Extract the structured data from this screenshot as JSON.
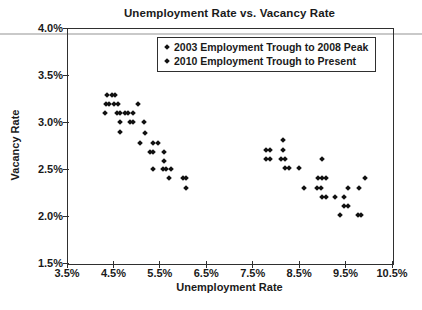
{
  "page": {
    "background": "#ffffff",
    "rule_color": "#c9c9c9",
    "text_color": "#1a1a1a",
    "marker_color": "#111111"
  },
  "chart_data": {
    "type": "scatter",
    "title": "Unemployment Rate vs. Vacancy Rate",
    "xlabel": "Unemployment Rate",
    "ylabel": "Vacancy Rate",
    "xlim": [
      3.5,
      10.5
    ],
    "ylim": [
      1.5,
      4.0
    ],
    "grid": false,
    "legend_position": "top-center-inside",
    "marker": "diamond",
    "x_ticks": [
      {
        "value": 3.5,
        "label": "3.5%"
      },
      {
        "value": 4.5,
        "label": "4.5%"
      },
      {
        "value": 5.5,
        "label": "5.5%"
      },
      {
        "value": 6.5,
        "label": "6.5%"
      },
      {
        "value": 7.5,
        "label": "7.5%"
      },
      {
        "value": 8.5,
        "label": "8.5%"
      },
      {
        "value": 9.5,
        "label": "9.5%"
      },
      {
        "value": 10.5,
        "label": "10.5%"
      }
    ],
    "y_ticks": [
      {
        "value": 4.0,
        "label": "4.0%"
      },
      {
        "value": 3.5,
        "label": "3.5%"
      },
      {
        "value": 3.0,
        "label": "3.0%"
      },
      {
        "value": 2.5,
        "label": "2.5%"
      },
      {
        "value": 2.0,
        "label": "2.0%"
      },
      {
        "value": 1.5,
        "label": "1.5%"
      }
    ],
    "series": [
      {
        "name": "2003 Employment Trough to 2008 Peak",
        "points": [
          [
            4.35,
            3.3
          ],
          [
            4.44,
            3.3
          ],
          [
            4.52,
            3.3
          ],
          [
            4.31,
            3.2
          ],
          [
            4.39,
            3.2
          ],
          [
            4.48,
            3.2
          ],
          [
            4.57,
            3.2
          ],
          [
            5.0,
            3.2
          ],
          [
            4.29,
            3.11
          ],
          [
            4.55,
            3.11
          ],
          [
            4.63,
            3.11
          ],
          [
            4.72,
            3.11
          ],
          [
            4.8,
            3.11
          ],
          [
            4.89,
            3.11
          ],
          [
            4.63,
            3.01
          ],
          [
            4.83,
            3.01
          ],
          [
            4.91,
            3.01
          ],
          [
            5.13,
            3.01
          ],
          [
            4.63,
            2.9
          ],
          [
            5.15,
            2.89
          ],
          [
            5.04,
            2.79
          ],
          [
            5.34,
            2.79
          ],
          [
            5.43,
            2.79
          ],
          [
            5.26,
            2.69
          ],
          [
            5.34,
            2.69
          ],
          [
            5.56,
            2.69
          ],
          [
            5.56,
            2.6
          ],
          [
            5.34,
            2.51
          ],
          [
            5.54,
            2.51
          ],
          [
            5.62,
            2.51
          ],
          [
            5.71,
            2.51
          ],
          [
            5.67,
            2.41
          ],
          [
            5.97,
            2.41
          ],
          [
            6.05,
            2.41
          ],
          [
            6.05,
            2.31
          ]
        ]
      },
      {
        "name": "2010 Employment Trough to Present",
        "points": [
          [
            8.12,
            2.82
          ],
          [
            7.76,
            2.71
          ],
          [
            7.84,
            2.71
          ],
          [
            8.12,
            2.71
          ],
          [
            7.76,
            2.62
          ],
          [
            7.84,
            2.62
          ],
          [
            8.08,
            2.62
          ],
          [
            8.17,
            2.62
          ],
          [
            8.96,
            2.62
          ],
          [
            8.17,
            2.52
          ],
          [
            8.25,
            2.52
          ],
          [
            8.47,
            2.52
          ],
          [
            8.88,
            2.41
          ],
          [
            8.96,
            2.41
          ],
          [
            9.05,
            2.41
          ],
          [
            9.89,
            2.41
          ],
          [
            8.58,
            2.31
          ],
          [
            8.86,
            2.31
          ],
          [
            8.94,
            2.31
          ],
          [
            9.52,
            2.31
          ],
          [
            9.76,
            2.31
          ],
          [
            8.96,
            2.21
          ],
          [
            9.05,
            2.21
          ],
          [
            9.24,
            2.21
          ],
          [
            9.44,
            2.21
          ],
          [
            9.44,
            2.12
          ],
          [
            9.52,
            2.12
          ],
          [
            9.35,
            2.02
          ],
          [
            9.74,
            2.02
          ],
          [
            9.82,
            2.02
          ]
        ]
      }
    ]
  }
}
